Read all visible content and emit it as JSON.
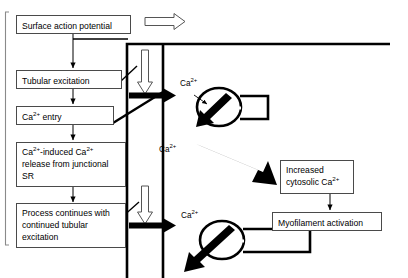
{
  "diagram": {
    "colors": {
      "box_border": "#4a4a4a",
      "membrane": "#000000",
      "background": "#ffffff",
      "text": "#000000"
    },
    "flow_boxes": [
      {
        "id": "surface-action-potential",
        "label": "Surface action potential"
      },
      {
        "id": "tubular-excitation",
        "label": "Tubular excitation"
      },
      {
        "id": "ca-entry",
        "label_html": "Ca<sup>2+</sup> entry"
      },
      {
        "id": "ca-induced-release",
        "label_html": "Ca<sup>2+</sup>-induced Ca<sup>2+</sup> release from junctional SR"
      },
      {
        "id": "process-continues",
        "label": "Process continues with continued tubular excitation"
      },
      {
        "id": "increased-cytosolic-ca",
        "label_html": "Increased cytosolic Ca<sup>2+</sup>"
      },
      {
        "id": "myofilament-activation",
        "label": "Myofilament activation"
      }
    ],
    "ion_labels": [
      {
        "id": "ca-label-upper",
        "text_html": "Ca<sup>2+</sup>"
      },
      {
        "id": "ca-label-middle",
        "text_html": "Ca<sup>2+</sup>"
      },
      {
        "id": "ca-label-lower",
        "text_html": "Ca<sup>2+</sup>"
      }
    ],
    "arrows": {
      "hollow_right_label": "propagation-direction",
      "hollow_down_count": 2,
      "thick_influx_count": 2,
      "thick_release_count": 2
    }
  }
}
